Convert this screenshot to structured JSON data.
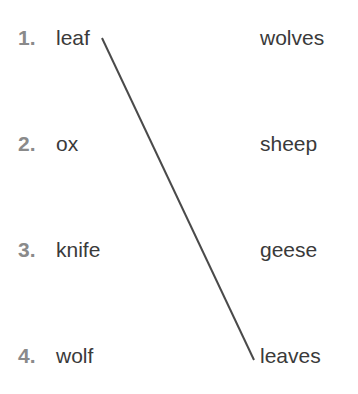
{
  "left_items": [
    {
      "number": "1.",
      "word": "leaf"
    },
    {
      "number": "2.",
      "word": "ox"
    },
    {
      "number": "3.",
      "word": "knife"
    },
    {
      "number": "4.",
      "word": "wolf"
    }
  ],
  "right_items": [
    {
      "word": "wolves"
    },
    {
      "word": "sheep"
    },
    {
      "word": "geese"
    },
    {
      "word": "leaves"
    }
  ],
  "connections": [
    {
      "from": "leaf",
      "to": "leaves",
      "color": "#4a4a4a"
    }
  ]
}
